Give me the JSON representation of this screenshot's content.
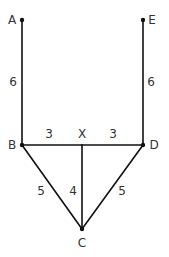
{
  "diagram": {
    "type": "graph",
    "nodes": [
      {
        "id": "A",
        "label": "A",
        "x": 22,
        "y": 20,
        "label_x": 12,
        "label_y": 20
      },
      {
        "id": "E",
        "label": "E",
        "x": 143,
        "y": 20,
        "label_x": 152,
        "label_y": 20
      },
      {
        "id": "B",
        "label": "B",
        "x": 22,
        "y": 145,
        "label_x": 12,
        "label_y": 145
      },
      {
        "id": "X",
        "label": "X",
        "x": 82,
        "y": 145,
        "label_x": 82,
        "label_y": 134
      },
      {
        "id": "D",
        "label": "D",
        "x": 143,
        "y": 145,
        "label_x": 154,
        "label_y": 145
      },
      {
        "id": "C",
        "label": "C",
        "x": 82,
        "y": 229,
        "label_x": 82,
        "label_y": 243
      }
    ],
    "edges": [
      {
        "from": "A",
        "to": "B",
        "weight": "6",
        "label_x": 13,
        "label_y": 82
      },
      {
        "from": "E",
        "to": "D",
        "weight": "6",
        "label_x": 151,
        "label_y": 82
      },
      {
        "from": "B",
        "to": "X",
        "weight": "3",
        "label_x": 49,
        "label_y": 134
      },
      {
        "from": "X",
        "to": "D",
        "weight": "3",
        "label_x": 113,
        "label_y": 134
      },
      {
        "from": "B",
        "to": "C",
        "weight": "5",
        "label_x": 41,
        "label_y": 191
      },
      {
        "from": "X",
        "to": "C",
        "weight": "4",
        "label_x": 73,
        "label_y": 191
      },
      {
        "from": "D",
        "to": "C",
        "weight": "5",
        "label_x": 122,
        "label_y": 191
      }
    ]
  }
}
